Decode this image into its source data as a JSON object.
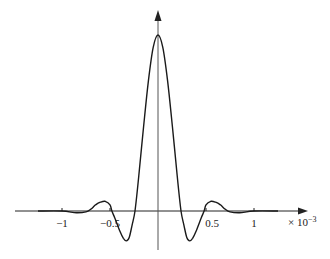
{
  "chart_data": {
    "type": "line",
    "title": "",
    "xlabel": "",
    "ylabel": "",
    "x_multiplier_label": "× 10⁻³",
    "x_ticks": [
      {
        "value": -1,
        "label": "−1"
      },
      {
        "value": -0.5,
        "label": "−0.5"
      },
      {
        "value": 0.5,
        "label": "0.5"
      },
      {
        "value": 1,
        "label": "1"
      }
    ],
    "xlim": [
      -1.5,
      1.5
    ],
    "ylim": [
      -0.2,
      1.1
    ],
    "grid": false,
    "legend": null,
    "series": [
      {
        "name": "response",
        "x": [
          -1.25,
          -1.0,
          -0.85,
          -0.75,
          -0.7,
          -0.65,
          -0.6,
          -0.55,
          -0.5,
          -0.48,
          -0.45,
          -0.4,
          -0.36,
          -0.33,
          -0.3,
          -0.27,
          -0.24,
          -0.2,
          -0.15,
          -0.1,
          -0.05,
          0,
          0.05,
          0.1,
          0.15,
          0.2,
          0.24,
          0.27,
          0.3,
          0.33,
          0.36,
          0.4,
          0.45,
          0.48,
          0.5,
          0.55,
          0.6,
          0.65,
          0.7,
          0.75,
          0.85,
          1.0,
          1.25
        ],
        "y": [
          0,
          0,
          -0.01,
          -0.005,
          0.01,
          0.035,
          0.05,
          0.055,
          0.035,
          0.0,
          -0.04,
          -0.11,
          -0.155,
          -0.17,
          -0.15,
          -0.08,
          0.0,
          0.2,
          0.48,
          0.74,
          0.93,
          1.0,
          0.93,
          0.74,
          0.48,
          0.2,
          0.0,
          -0.08,
          -0.15,
          -0.17,
          -0.155,
          -0.11,
          -0.04,
          0.0,
          0.035,
          0.055,
          0.05,
          0.035,
          0.01,
          -0.005,
          -0.01,
          0,
          0
        ]
      }
    ]
  },
  "axes": {
    "x_multiplier": "× 10",
    "x_exponent": "−3"
  }
}
